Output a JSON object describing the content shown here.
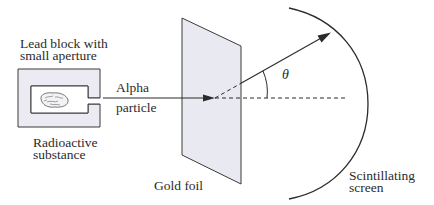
{
  "diagram": {
    "labels": {
      "lead_block_line1": "Lead block with",
      "lead_block_line2": "small aperture",
      "alpha_line1": "Alpha",
      "alpha_line2": "particle",
      "radioactive_line1": "Radioactive",
      "radioactive_line2": "substance",
      "gold_foil": "Gold foil",
      "screen_line1": "Scintillating",
      "screen_line2": "screen",
      "angle": "θ"
    },
    "colors": {
      "line": "#2b2b2b",
      "fill_block": "#ecebf3",
      "fill_foil": "#e9e9f2",
      "background": "#ffffff"
    }
  }
}
